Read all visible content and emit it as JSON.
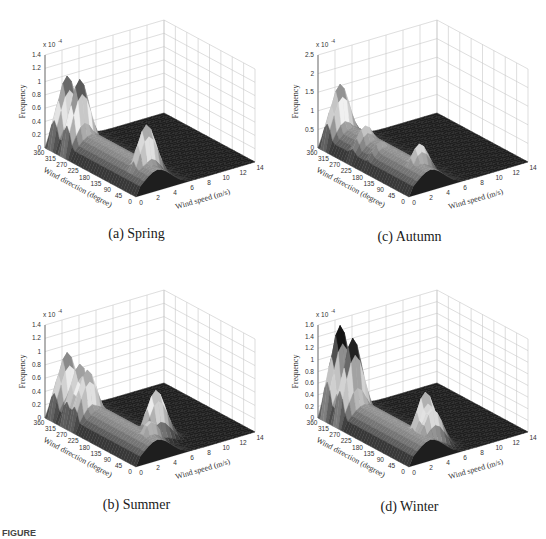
{
  "figure_caption_prefix": "FIGURE",
  "chart_data": [
    {
      "id": "a",
      "type": "surface3d",
      "title": "(a) Spring",
      "xlabel": "Wind speed (m/s)",
      "ylabel": "Wind direction (degree)",
      "zlabel": "Frequency",
      "z_multiplier": "x 10^-4",
      "x_ticks": [
        0,
        2,
        4,
        6,
        8,
        10,
        12,
        14
      ],
      "y_ticks": [
        360,
        315,
        270,
        225,
        180,
        135,
        90,
        45,
        0
      ],
      "z_ticks": [
        0,
        0.2,
        0.4,
        0.6,
        0.8,
        1,
        1.2,
        1.4
      ],
      "zlim": [
        0,
        1.4
      ],
      "grid": true,
      "peaks": [
        {
          "direction": 340,
          "speed": 2,
          "frequency": 1.05
        },
        {
          "direction": 290,
          "speed": 2,
          "frequency": 1.1
        },
        {
          "direction": 60,
          "speed": 3,
          "frequency": 0.85
        }
      ]
    },
    {
      "id": "b",
      "type": "surface3d",
      "title": "(b) Summer",
      "xlabel": "Wind speed (m/s)",
      "ylabel": "Wind direction (degree)",
      "zlabel": "Frequency",
      "z_multiplier": "x 10^-4",
      "x_ticks": [
        0,
        2,
        4,
        6,
        8,
        10,
        12,
        14
      ],
      "y_ticks": [
        360,
        315,
        270,
        225,
        180,
        135,
        90,
        45,
        0
      ],
      "z_ticks": [
        0,
        0.2,
        0.4,
        0.6,
        0.8,
        1,
        1.2,
        1.4
      ],
      "zlim": [
        0,
        1.4
      ],
      "grid": true,
      "peaks": [
        {
          "direction": 340,
          "speed": 2,
          "frequency": 0.95
        },
        {
          "direction": 290,
          "speed": 2,
          "frequency": 0.88
        },
        {
          "direction": 260,
          "speed": 2,
          "frequency": 0.85
        },
        {
          "direction": 90,
          "speed": 5,
          "frequency": 0.78
        },
        {
          "direction": 45,
          "speed": 3,
          "frequency": 0.5
        }
      ]
    },
    {
      "id": "c",
      "type": "surface3d",
      "title": "(c) Autumn",
      "xlabel": "Wind speed (m/s)",
      "ylabel": "Wind direction (degree)",
      "zlabel": "Frequency",
      "z_multiplier": "x 10^-4",
      "x_ticks": [
        0,
        2,
        4,
        6,
        8,
        10,
        12,
        14
      ],
      "y_ticks": [
        360,
        315,
        270,
        225,
        180,
        135,
        90,
        45,
        0
      ],
      "z_ticks": [
        0,
        0.5,
        1,
        1.5,
        2,
        2.5
      ],
      "zlim": [
        0,
        2.5
      ],
      "grid": true,
      "peaks": [
        {
          "direction": 340,
          "speed": 2,
          "frequency": 1.65
        },
        {
          "direction": 240,
          "speed": 2,
          "frequency": 0.9
        },
        {
          "direction": 180,
          "speed": 2,
          "frequency": 0.7
        },
        {
          "direction": 60,
          "speed": 3,
          "frequency": 1.0
        }
      ]
    },
    {
      "id": "d",
      "type": "surface3d",
      "title": "(d) Winter",
      "xlabel": "Wind speed (m/s)",
      "ylabel": "Wind direction (degree)",
      "zlabel": "Frequency",
      "z_multiplier": "x 10^-4",
      "x_ticks": [
        0,
        2,
        4,
        6,
        8,
        10,
        12,
        14
      ],
      "y_ticks": [
        360,
        315,
        270,
        225,
        180,
        135,
        90,
        45,
        0
      ],
      "z_ticks": [
        0,
        0.2,
        0.4,
        0.6,
        0.8,
        1,
        1.2,
        1.4,
        1.6
      ],
      "zlim": [
        0,
        1.6
      ],
      "grid": true,
      "peaks": [
        {
          "direction": 340,
          "speed": 2,
          "frequency": 1.55
        },
        {
          "direction": 290,
          "speed": 2,
          "frequency": 1.45
        },
        {
          "direction": 70,
          "speed": 4,
          "frequency": 0.95
        },
        {
          "direction": 45,
          "speed": 4,
          "frequency": 0.75
        }
      ]
    }
  ]
}
